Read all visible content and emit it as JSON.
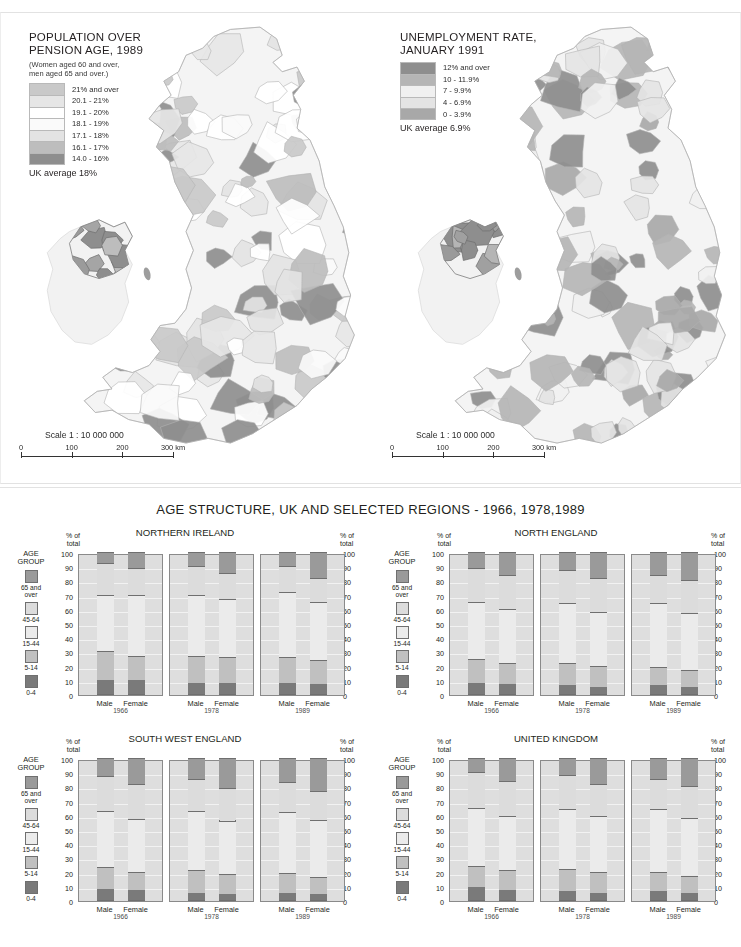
{
  "maps": [
    {
      "id": "population-over-pension-age",
      "title": "POPULATION OVER\nPENSION AGE, 1989",
      "subtitle": "(Women aged 60 and over,\nmen aged 65 and over.)",
      "legend": [
        {
          "label": "21% and over",
          "color": "#c9c9c9"
        },
        {
          "label": "20.1 - 21%",
          "color": "#e6e6e6"
        },
        {
          "label": "19.1 - 20%",
          "color": "#ffffff"
        },
        {
          "label": "18.1 - 19%",
          "color": "#fafafa"
        },
        {
          "label": "17.1 - 18%",
          "color": "#e3e3e3"
        },
        {
          "label": "16.1 - 17%",
          "color": "#bdbdbd"
        },
        {
          "label": "14.0 - 16%",
          "color": "#8e8e8e"
        }
      ],
      "average": "UK average 18%",
      "scale": {
        "text": "Scale 1 : 10 000 000",
        "ticks": [
          "0",
          "100",
          "200",
          "300 km"
        ]
      }
    },
    {
      "id": "unemployment-rate",
      "title": "UNEMPLOYMENT RATE,\nJANUARY 1991",
      "subtitle": "",
      "legend": [
        {
          "label": "12% and over",
          "color": "#8e8e8e"
        },
        {
          "label": "10 - 11.9%",
          "color": "#b5b5b5"
        },
        {
          "label": "7 - 9.9%",
          "color": "#f0f0f0"
        },
        {
          "label": "4 - 6.9%",
          "color": "#e4e4e4"
        },
        {
          "label": "0 - 3.9%",
          "color": "#a8a8a8"
        }
      ],
      "average": "UK average 6.9%",
      "scale": {
        "text": "Scale 1 : 10 000 000",
        "ticks": [
          "0",
          "100",
          "200",
          "300 km"
        ]
      }
    }
  ],
  "charts": {
    "title": "AGE STRUCTURE, UK AND SELECTED REGIONS - 1966, 1978,1989",
    "axis_label": "% of\ntotal",
    "y_ticks": [
      100,
      90,
      80,
      70,
      60,
      50,
      40,
      30,
      20,
      10,
      0
    ],
    "years": [
      "1966",
      "1978",
      "1989"
    ],
    "sexes": [
      "Male",
      "Female"
    ],
    "age_group_key": {
      "header": "AGE\nGROUP",
      "items": [
        {
          "label": "65 and\nover",
          "color": "#9a9a9a"
        },
        {
          "label": "45-64",
          "color": "#dcdcdc"
        },
        {
          "label": "15-44",
          "color": "#ebebeb"
        },
        {
          "label": "5-14",
          "color": "#c0c0c0"
        },
        {
          "label": "0-4",
          "color": "#7a7a7a"
        }
      ]
    }
  },
  "chart_data": [
    {
      "type": "bar",
      "stacked": true,
      "title": "NORTHERN IRELAND",
      "xlabel": "",
      "ylabel": "% of total",
      "ylim": [
        0,
        100
      ],
      "grid": true,
      "categories": [
        "1966 Male",
        "1966 Female",
        "1978 Male",
        "1978 Female",
        "1989 Male",
        "1989 Female"
      ],
      "series": [
        {
          "name": "0-4",
          "values": [
            10,
            10,
            8,
            8,
            8,
            7
          ]
        },
        {
          "name": "5-14",
          "values": [
            20,
            17,
            19,
            18,
            18,
            17
          ]
        },
        {
          "name": "15-44",
          "values": [
            40,
            43,
            43,
            41,
            46,
            41
          ]
        },
        {
          "name": "45-64",
          "values": [
            22,
            19,
            20,
            18,
            18,
            17
          ]
        },
        {
          "name": "65 and over",
          "values": [
            8,
            11,
            10,
            15,
            10,
            18
          ]
        }
      ]
    },
    {
      "type": "bar",
      "stacked": true,
      "title": "NORTH ENGLAND",
      "xlabel": "",
      "ylabel": "% of total",
      "ylim": [
        0,
        100
      ],
      "grid": true,
      "categories": [
        "1966 Male",
        "1966 Female",
        "1978 Male",
        "1978 Female",
        "1989 Male",
        "1989 Female"
      ],
      "series": [
        {
          "name": "0-4",
          "values": [
            8,
            7,
            6,
            5,
            6,
            5
          ]
        },
        {
          "name": "5-14",
          "values": [
            17,
            15,
            16,
            15,
            13,
            12
          ]
        },
        {
          "name": "15-44",
          "values": [
            40,
            38,
            42,
            38,
            45,
            40
          ]
        },
        {
          "name": "45-64",
          "values": [
            24,
            24,
            23,
            24,
            20,
            23
          ]
        },
        {
          "name": "65 and over",
          "values": [
            11,
            16,
            13,
            18,
            16,
            20
          ]
        }
      ]
    },
    {
      "type": "bar",
      "stacked": true,
      "title": "SOUTH WEST ENGLAND",
      "xlabel": "",
      "ylabel": "% of total",
      "ylim": [
        0,
        100
      ],
      "grid": true,
      "categories": [
        "1966 Male",
        "1966 Female",
        "1978 Male",
        "1978 Female",
        "1989 Male",
        "1989 Female"
      ],
      "series": [
        {
          "name": "0-4",
          "values": [
            8,
            7,
            5,
            4,
            5,
            4
          ]
        },
        {
          "name": "5-14",
          "values": [
            15,
            13,
            16,
            14,
            14,
            12
          ]
        },
        {
          "name": "15-44",
          "values": [
            40,
            37,
            42,
            38,
            43,
            40
          ]
        },
        {
          "name": "45-64",
          "values": [
            24,
            25,
            22,
            23,
            21,
            21
          ]
        },
        {
          "name": "65 and over",
          "values": [
            13,
            18,
            15,
            21,
            17,
            23
          ]
        }
      ]
    },
    {
      "type": "bar",
      "stacked": true,
      "title": "UNITED KINGDOM",
      "xlabel": "",
      "ylabel": "% of total",
      "ylim": [
        0,
        100
      ],
      "grid": true,
      "categories": [
        "1966 Male",
        "1966 Female",
        "1978 Male",
        "1978 Female",
        "1989 Male",
        "1989 Female"
      ],
      "series": [
        {
          "name": "0-4",
          "values": [
            9,
            7,
            6,
            5,
            6,
            5
          ]
        },
        {
          "name": "5-14",
          "values": [
            15,
            14,
            16,
            15,
            14,
            12
          ]
        },
        {
          "name": "15-44",
          "values": [
            41,
            38,
            42,
            39,
            44,
            41
          ]
        },
        {
          "name": "45-64",
          "values": [
            25,
            25,
            24,
            23,
            21,
            22
          ]
        },
        {
          "name": "65 and over",
          "values": [
            10,
            16,
            12,
            18,
            15,
            20
          ]
        }
      ]
    }
  ]
}
